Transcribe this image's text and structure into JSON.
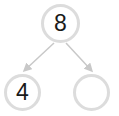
{
  "diagram": {
    "type": "number-bond",
    "whole": {
      "value": "8"
    },
    "parts": [
      {
        "value": "4"
      },
      {
        "value": ""
      }
    ],
    "colors": {
      "circle_border": "#dcdcdc",
      "arrow": "#c8c8c8",
      "text": "#1a1a1a"
    }
  }
}
